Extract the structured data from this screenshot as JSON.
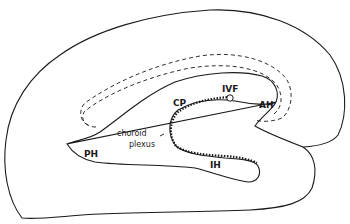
{
  "diagram": {
    "type": "anatomical-diagram",
    "labels": {
      "cp": "CP",
      "ivf": "IVF",
      "ah": "AH",
      "ph": "PH",
      "ih": "IH",
      "choroid_line1": "choroid",
      "choroid_line2": "plexus"
    },
    "colors": {
      "line": "#1a1a1a",
      "background": "#ffffff"
    }
  }
}
